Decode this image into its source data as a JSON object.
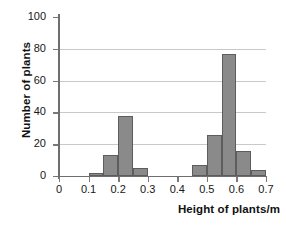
{
  "chart_data": {
    "type": "bar",
    "title": "",
    "subtitle": "",
    "xlabel": "Height of plants/m",
    "ylabel": "Number of plants",
    "xlim": [
      0,
      0.7
    ],
    "ylim": [
      0,
      100
    ],
    "grid": true,
    "legend": false,
    "legend_position": "none",
    "bar_color": "#8a8a8a",
    "bar_edge_color": "#5d5d5d",
    "axis_color": "#6e6e6e",
    "gridline_color": "#c9c9c9",
    "x_ticks": [
      "0",
      "0.1",
      "0.2",
      "0.3",
      "0.4",
      "0.5",
      "0.6",
      "0.7"
    ],
    "x_tick_values": [
      0,
      0.1,
      0.2,
      0.3,
      0.4,
      0.5,
      0.6,
      0.7
    ],
    "y_ticks": [
      "0",
      "20",
      "40",
      "60",
      "80",
      "100"
    ],
    "y_tick_values": [
      0,
      20,
      40,
      60,
      80,
      100
    ],
    "bin_width": 0.05,
    "bins": [
      {
        "x0": 0.1,
        "x1": 0.15,
        "value": 2
      },
      {
        "x0": 0.15,
        "x1": 0.2,
        "value": 13
      },
      {
        "x0": 0.2,
        "x1": 0.25,
        "value": 38
      },
      {
        "x0": 0.25,
        "x1": 0.3,
        "value": 5
      },
      {
        "x0": 0.45,
        "x1": 0.5,
        "value": 7
      },
      {
        "x0": 0.5,
        "x1": 0.55,
        "value": 26
      },
      {
        "x0": 0.55,
        "x1": 0.6,
        "value": 77
      },
      {
        "x0": 0.6,
        "x1": 0.65,
        "value": 16
      },
      {
        "x0": 0.65,
        "x1": 0.7,
        "value": 4
      }
    ],
    "categories": [
      "0.10-0.15",
      "0.15-0.20",
      "0.20-0.25",
      "0.25-0.30",
      "0.45-0.50",
      "0.50-0.55",
      "0.55-0.60",
      "0.60-0.65",
      "0.65-0.70"
    ],
    "values": [
      2,
      13,
      38,
      5,
      7,
      26,
      77,
      16,
      4
    ]
  }
}
